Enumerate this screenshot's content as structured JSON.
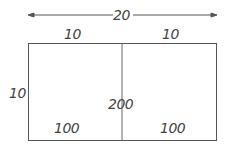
{
  "diagram": {
    "top_dimension": "20",
    "left_half_width": "10",
    "right_half_width": "10",
    "height": "10",
    "total_area": "200",
    "left_area": "100",
    "right_area": "100",
    "line_color": "#555555",
    "text_color": "#444444"
  }
}
